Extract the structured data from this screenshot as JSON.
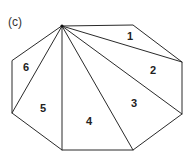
{
  "panel_label": "(c)",
  "figure": {
    "type": "triangulated-octagon",
    "vertices": [
      [
        62,
        26
      ],
      [
        133,
        25
      ],
      [
        182,
        62
      ],
      [
        182,
        114
      ],
      [
        133,
        150
      ],
      [
        62,
        150
      ],
      [
        12,
        113
      ],
      [
        12,
        61
      ]
    ],
    "diagonals_from_vertex": 0,
    "regions": [
      {
        "label": "1",
        "x": 131,
        "y": 40
      },
      {
        "label": "2",
        "x": 153,
        "y": 74
      },
      {
        "label": "3",
        "x": 134,
        "y": 107
      },
      {
        "label": "4",
        "x": 89,
        "y": 125
      },
      {
        "label": "5",
        "x": 43,
        "y": 112
      },
      {
        "label": "6",
        "x": 26,
        "y": 71
      }
    ]
  },
  "colors": {
    "line": "#2a2a2a",
    "text": "#222222",
    "background": "#ffffff"
  }
}
